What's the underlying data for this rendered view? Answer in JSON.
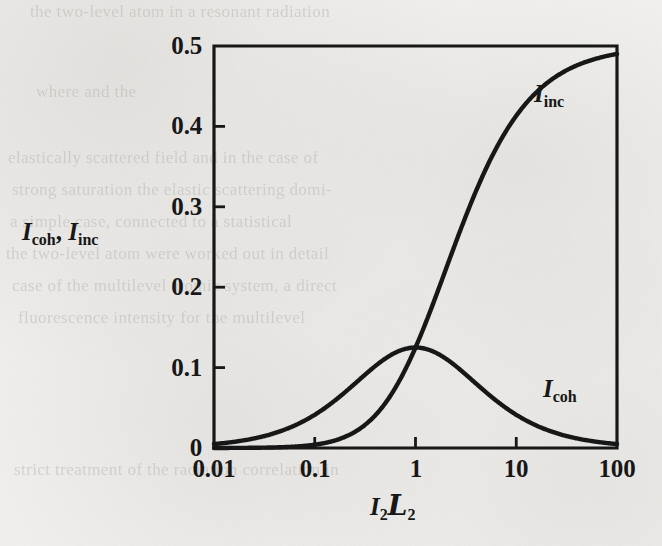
{
  "figure": {
    "background_color": "#f2f1ef",
    "ink_color": "#171717"
  },
  "axes": {
    "y_label_parts": {
      "sym1": "I",
      "sub1": "coh",
      "separator": ", ",
      "sym2": "I",
      "sub2": "inc"
    },
    "y_label_text": "I_coh, I_inc",
    "x_label_parts": {
      "sym1": "I",
      "sub1": "2",
      "sym2": "L",
      "sub2": "2"
    },
    "x_label_text": "I₂𝓛₂",
    "y_ticks": [
      "0.5",
      "0.4",
      "0.3",
      "0.2",
      "0.1",
      "0"
    ],
    "x_ticks": [
      "0.01",
      "0.1",
      "1",
      "10",
      "100"
    ]
  },
  "curves": {
    "inc": {
      "label_sym": "I",
      "label_sub": "inc",
      "label_text": "I_inc"
    },
    "coh": {
      "label_sym": "I",
      "label_sub": "coh",
      "label_text": "I_coh"
    }
  },
  "ghost_text": {
    "lines": [
      "the two-level atom in a resonant radiation",
      "where                              and                    the",
      "elastically scattered field and in the case of",
      "strong saturation the elastic scattering domi-",
      "a simple case, connected to a statistical",
      "the two-level atom were worked out in detail",
      "case of the multilevel atomic system, a direct",
      "fluorescence intensity for the multilevel",
      "strict treatment of the radiation correlation in"
    ]
  },
  "chart_data": {
    "type": "line",
    "title": "",
    "xlabel": "I₂𝓛₂",
    "ylabel": "I_coh, I_inc",
    "xscale": "log",
    "yscale": "linear",
    "xlim": [
      0.01,
      100
    ],
    "ylim": [
      0,
      0.5
    ],
    "xticks": [
      0.01,
      0.1,
      1,
      10,
      100
    ],
    "xticklabels": [
      "0.01",
      "0.1",
      "1",
      "10",
      "100"
    ],
    "yticks": [
      0,
      0.1,
      0.2,
      0.3,
      0.4,
      0.5
    ],
    "yticklabels": [
      "0",
      "0.1",
      "0.2",
      "0.3",
      "0.4",
      "0.5"
    ],
    "grid": false,
    "legend": "inline-annotations",
    "annotations": [
      {
        "text": "I_inc",
        "x": 30,
        "y": 0.432
      },
      {
        "text": "I_coh",
        "x": 40,
        "y": 0.068
      }
    ],
    "x": [
      0.01,
      0.0158,
      0.0251,
      0.0398,
      0.0631,
      0.1,
      0.158,
      0.251,
      0.398,
      0.631,
      1.0,
      1.585,
      2.512,
      3.981,
      6.31,
      10.0,
      15.85,
      25.12,
      39.81,
      63.1,
      100.0
    ],
    "series": [
      {
        "name": "I_coh",
        "formula": "s / (2 * (1 + s)^2)",
        "values": [
          0.0049,
          0.0077,
          0.012,
          0.0184,
          0.0279,
          0.0413,
          0.0589,
          0.0802,
          0.1018,
          0.1187,
          0.125,
          0.1187,
          0.1021,
          0.0799,
          0.0588,
          0.0413,
          0.0279,
          0.0185,
          0.0119,
          0.0077,
          0.0049
        ]
      },
      {
        "name": "I_inc",
        "formula": "s^2 / (2 * (1 + s)^2)",
        "values": [
          5e-05,
          0.00012,
          0.0003,
          0.00073,
          0.00176,
          0.00413,
          0.00931,
          0.02013,
          0.04052,
          0.0749,
          0.125,
          0.1881,
          0.2565,
          0.3181,
          0.3711,
          0.4132,
          0.4421,
          0.4617,
          0.4755,
          0.4844,
          0.4901
        ]
      }
    ]
  }
}
